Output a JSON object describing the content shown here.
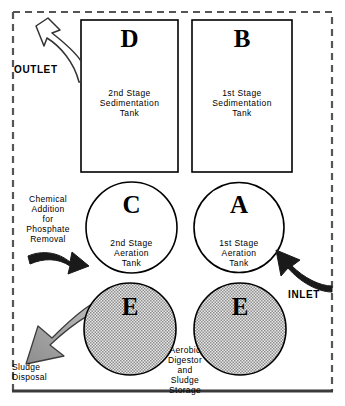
{
  "diagram": {
    "border_style": "dashed",
    "colors": {
      "outline": "#000000",
      "shaded_fill": "#b5b5b5",
      "solid_arrow": "#1a1a1a",
      "background": "#ffffff"
    },
    "tanks": [
      {
        "id": "D",
        "letter": "D",
        "shape": "rect",
        "description": "2nd Stage\nSedimentation\nTank"
      },
      {
        "id": "B",
        "letter": "B",
        "shape": "rect",
        "description": "1st Stage\nSedimentation\nTank"
      },
      {
        "id": "C",
        "letter": "C",
        "shape": "circle",
        "description": "2nd Stage\nAeration\nTank"
      },
      {
        "id": "A",
        "letter": "A",
        "shape": "circle",
        "description": "1st Stage\nAeration\nTank"
      },
      {
        "id": "E-left",
        "letter": "E",
        "shape": "circle",
        "description": ""
      },
      {
        "id": "E-right",
        "letter": "E",
        "shape": "circle",
        "description": ""
      }
    ],
    "flows": {
      "outlet_label": "OUTLET",
      "inlet_label": "INLET",
      "chemical_label": "Chemical\nAddition\nfor\nPhosphate\nRemoval",
      "sludge_disposal_label": "Sludge\nDisposal",
      "digestor_label": "Aerobic\nDigestor\nand\nSludge\nStorage"
    }
  }
}
